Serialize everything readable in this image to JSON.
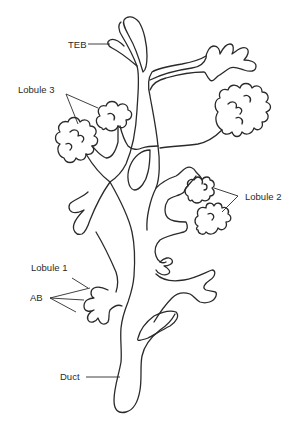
{
  "diagram": {
    "line_color": "#2a2a2a",
    "background": "#ffffff",
    "labels": {
      "teb": "TEB",
      "lobule3": "Lobule 3",
      "lobule2": "Lobule 2",
      "lobule1": "Lobule 1",
      "ab": "AB",
      "duct": "Duct"
    }
  }
}
